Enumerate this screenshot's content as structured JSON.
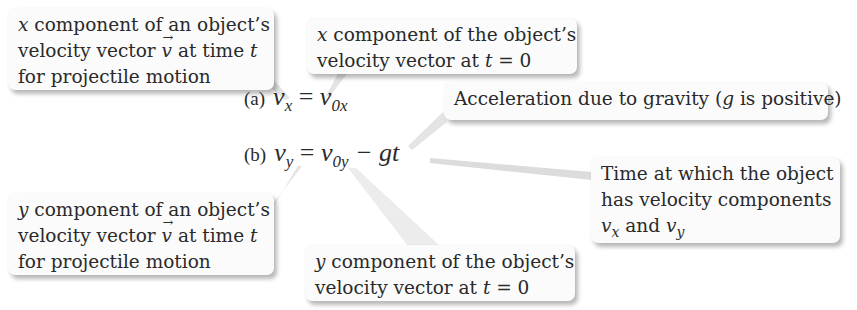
{
  "equations": [
    {
      "label": "(a)",
      "lhs_var": "v",
      "lhs_sub": "x",
      "equals": "=",
      "rhs_var": "v",
      "rhs_sub": "0x",
      "rhs_rest": ""
    },
    {
      "label": "(b)",
      "lhs_var": "v",
      "lhs_sub": "y",
      "equals": "=",
      "rhs_var": "v",
      "rhs_sub": "0y",
      "rhs_rest": "− gt"
    }
  ],
  "callouts": {
    "vx_def": {
      "var": "x",
      "line1_rest": " component of an object’s",
      "line2_pre": "velocity vector ",
      "vec": "v",
      "line2_post": " at time ",
      "t": "t",
      "line3": "for projectile motion"
    },
    "v0x_def": {
      "var": "x",
      "line1_rest": " component of the object’s",
      "line2_pre": "velocity vector at ",
      "t": "t",
      "line2_post": " = 0"
    },
    "gravity": {
      "pre": "Acceleration due to gravity (",
      "g": "g",
      "post": " is positive)"
    },
    "time_def": {
      "line1": "Time at which the object",
      "line2": "has velocity components",
      "v1": "v",
      "s1": "x",
      "and": " and ",
      "v2": "v",
      "s2": "y"
    },
    "vy_def": {
      "var": "y",
      "line1_rest": " component of an object’s",
      "line2_pre": "velocity vector ",
      "vec": "v",
      "line2_post": " at time ",
      "t": "t",
      "line3": "for projectile motion"
    },
    "v0y_def": {
      "var": "y",
      "line1_rest": " component of the object’s",
      "line2_pre": "velocity vector at ",
      "t": "t",
      "line2_post": " = 0"
    }
  },
  "colors": {
    "box_bg": "#fbfbfb",
    "text": "#2a2a2a",
    "leader": "#c8c8c8"
  }
}
